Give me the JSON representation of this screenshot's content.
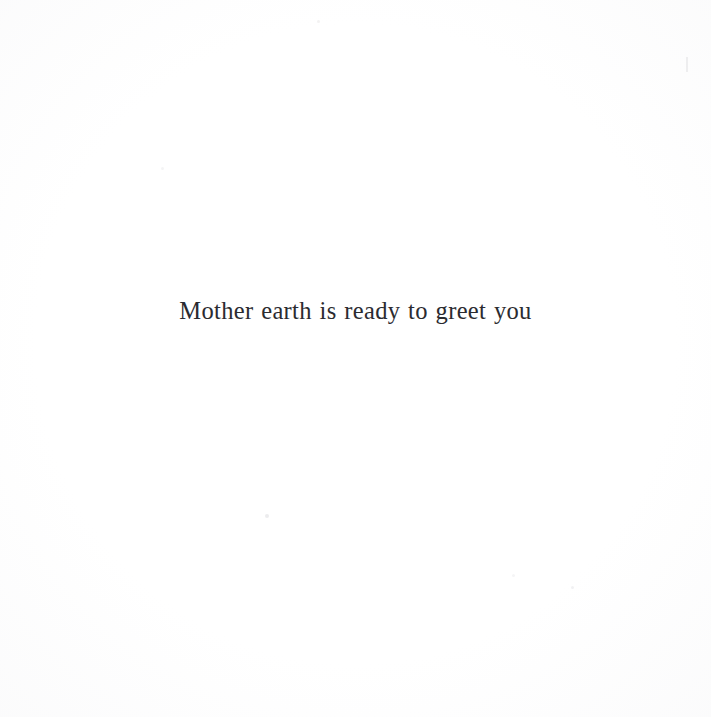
{
  "page": {
    "width": 711,
    "height": 717,
    "background_color": "#ffffff",
    "medium": "scanned book page"
  },
  "text": {
    "body_line": "Mother earth is ready to greet you",
    "color": "#2b2b30",
    "alignment": "center",
    "typeface_style": "serif"
  },
  "artifacts": {
    "description": "faint scanner dust specks and a small edge mark",
    "speck_center_low": "",
    "speck_right_low": "",
    "speck_mid_right": "",
    "speck_top_mid": "",
    "speck_left_mid": "",
    "edge_mark_right": ""
  }
}
